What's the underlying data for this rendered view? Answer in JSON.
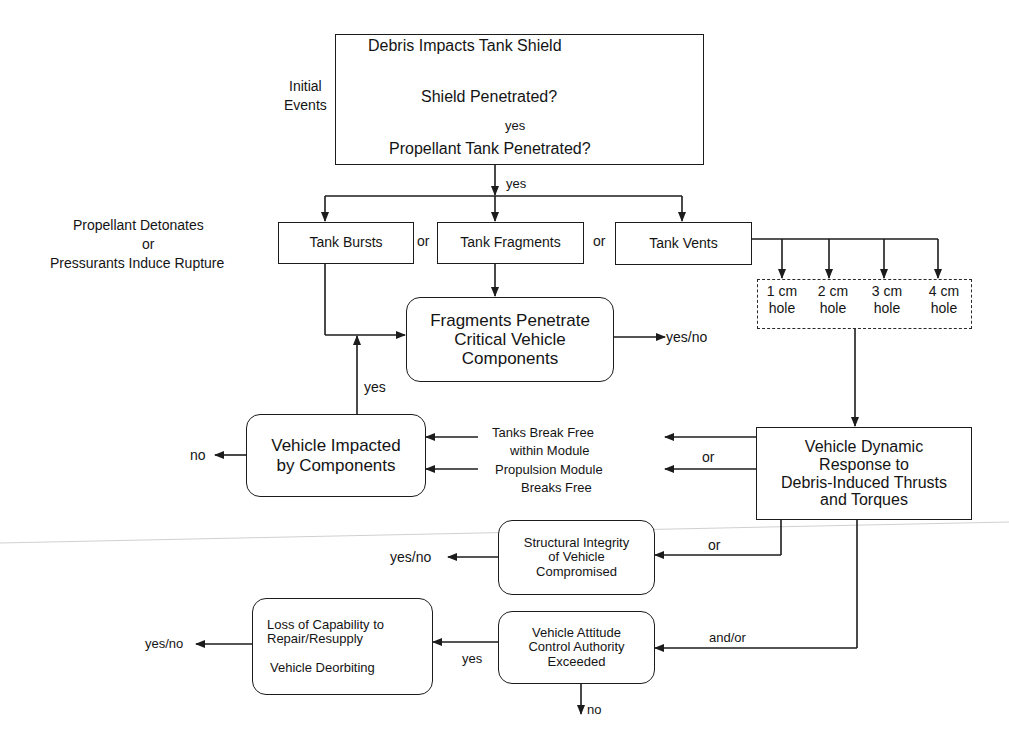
{
  "diagram": {
    "initial_box": {
      "line1": "Debris Impacts Tank Shield",
      "line2": "Shield Penetrated?",
      "line3": "Propellant Tank Penetrated?",
      "inner_yes": "yes"
    },
    "side_labels": {
      "initial_events_1": "Initial",
      "initial_events_2": "Events",
      "detonate_1": "Propellant Detonates",
      "detonate_2": "or",
      "detonate_3": "Pressurants Induce Rupture"
    },
    "branch_yes": "yes",
    "tank_outcomes": [
      {
        "label": "Tank Bursts"
      },
      {
        "label": "Tank Fragments"
      },
      {
        "label": "Tank Vents"
      }
    ],
    "or_labels": [
      "or",
      "or"
    ],
    "holes": [
      {
        "size": "1 cm",
        "word": "hole"
      },
      {
        "size": "2 cm",
        "word": "hole"
      },
      {
        "size": "3 cm",
        "word": "hole"
      },
      {
        "size": "4 cm",
        "word": "hole"
      }
    ],
    "fragments_box": {
      "line1": "Fragments Penetrate",
      "line2": "Critical Vehicle",
      "line3": "Components",
      "outcome": "yes/no"
    },
    "impacted_box": {
      "line1": "Vehicle Impacted",
      "line2": "by Components",
      "yes_label": "yes",
      "no_label": "no"
    },
    "break_free": {
      "tanks_1": "Tanks Break Free",
      "tanks_2": "within Module",
      "prop_1": "Propulsion Module",
      "prop_2": "Breaks Free",
      "or_label": "or"
    },
    "dynamic_box": {
      "line1": "Vehicle Dynamic",
      "line2": "Response to",
      "line3": "Debris-Induced Thrusts",
      "line4": "and Torques"
    },
    "structural_box": {
      "line1": "Structural Integrity",
      "line2": "of Vehicle",
      "line3": "Compromised",
      "outcome": "yes/no",
      "or_label": "or"
    },
    "attitude_box": {
      "line1": "Vehicle Attitude",
      "line2": "Control Authority",
      "line3": "Exceeded",
      "yes_label": "yes",
      "no_label": "no",
      "andor_label": "and/or"
    },
    "loss_box": {
      "line1": "Loss of Capability to",
      "line2": "Repair/Resupply",
      "line3": "Vehicle Deorbiting",
      "outcome": "yes/no"
    }
  },
  "colors": {
    "line": "#1c1c1c",
    "background": "#ffffff",
    "scan_artifact": "#c8c8c8"
  }
}
